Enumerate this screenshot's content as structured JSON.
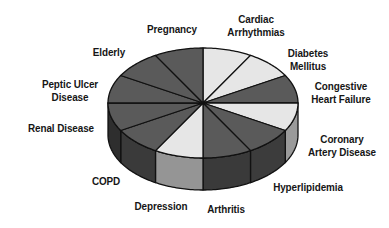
{
  "chart_data": {
    "type": "pie",
    "style": "3d-exploded-none",
    "title": "",
    "start_angle_deg": 90,
    "direction": "clockwise",
    "center": [
      203,
      103
    ],
    "radius_x": 95,
    "radius_y": 55,
    "depth": 32,
    "categories": [
      "Cardiac Arrhythmias",
      "Diabetes Mellitus",
      "Congestive Heart Failure",
      "Coronary Artery Disease",
      "Hyperlipidemia",
      "Arthritis",
      "Depression",
      "COPD",
      "Renal Disease",
      "Peptic Ulcer Disease",
      "Elderly",
      "Pregnancy"
    ],
    "values": [
      1,
      1,
      1,
      1,
      1,
      1,
      1,
      1,
      1,
      1,
      1,
      1
    ],
    "top_colors": [
      "#e6e6e6",
      "#e6e6e6",
      "#5a5a5a",
      "#e6e6e6",
      "#5a5a5a",
      "#5a5a5a",
      "#e6e6e6",
      "#5a5a5a",
      "#5a5a5a",
      "#5a5a5a",
      "#5a5a5a",
      "#5a5a5a"
    ],
    "side_colors": [
      "#b8b8b8",
      "#b8b8b8",
      "#3a3a3a",
      "#9a9a9a",
      "#3c3c3c",
      "#3a3a3a",
      "#959595",
      "#3a3a3a",
      "#2e2e2e",
      "#2e2e2e",
      "#2e2e2e",
      "#2e2e2e"
    ],
    "legend": "none",
    "labels": {
      "cardiac": [
        "Cardiac",
        "Arrhythmias"
      ],
      "diabetes": [
        "Diabetes",
        "Mellitus"
      ],
      "chf": [
        "Congestive",
        "Heart Failure"
      ],
      "cad": [
        "Coronary",
        "Artery Disease"
      ],
      "hyperlipidemia": [
        "Hyperlipidemia"
      ],
      "arthritis": [
        "Arthritis"
      ],
      "depression": [
        "Depression"
      ],
      "copd": [
        "COPD"
      ],
      "renal": [
        "Renal Disease"
      ],
      "peptic": [
        "Peptic Ulcer",
        "Disease"
      ],
      "elderly": [
        "Elderly"
      ],
      "pregnancy": [
        "Pregnancy"
      ]
    }
  }
}
